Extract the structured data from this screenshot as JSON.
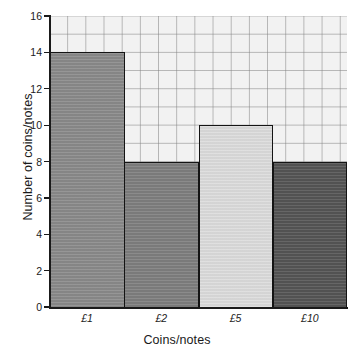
{
  "chart_data": {
    "type": "bar",
    "title": "",
    "xlabel": "Coins/notes",
    "ylabel": "Number of coins/notes",
    "categories": [
      "£1",
      "£2",
      "£5",
      "£10"
    ],
    "values": [
      14,
      8,
      10,
      8
    ],
    "ylim": [
      0,
      16
    ],
    "yticks": [
      0,
      2,
      4,
      6,
      8,
      10,
      12,
      14,
      16
    ],
    "ytick_labels": [
      "0",
      "2",
      "4",
      "6",
      "8",
      "10",
      "12",
      "14",
      "16"
    ],
    "grid": true,
    "grid_color": "#828282",
    "plot_background": "#f2f2f2",
    "legend": null,
    "bar_colors": [
      "#8a8a8a",
      "#7e7e7e",
      "#dcdcdc",
      "#555555"
    ],
    "bar_edge_color": "#141414"
  }
}
